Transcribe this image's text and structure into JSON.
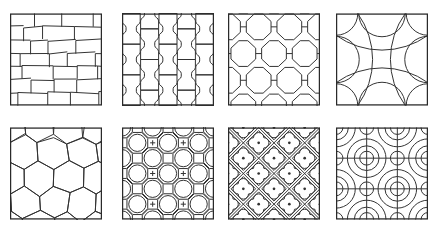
{
  "figure": {
    "name": "paving-pattern-catalog",
    "background": "#ffffff",
    "line_color": "#323232",
    "frame_color": "#2a2a2a",
    "grid": {
      "rows": 2,
      "columns": 4
    },
    "swatches": [
      {
        "name": "irregular-running-bond-brick",
        "type": "brick",
        "description": "staggered rectangular bricks in slightly irregular slanted courses",
        "rows": 7
      },
      {
        "name": "i-shaped-interlocking-pavers",
        "type": "spool",
        "description": "columns of dog-bone / I-shaped interlocking pavers, half-offset",
        "columns": 5
      },
      {
        "name": "uni-decor-octagon-pavers",
        "type": "octolink",
        "description": "staggered chamfered octagon pavers with short horizontal joint connectors"
      },
      {
        "name": "curved-bowtie-pavers",
        "type": "bowtie",
        "description": "interlocking curved bowtie and fan shaped paving units"
      },
      {
        "name": "irregular-hexagon-pavers",
        "type": "hex",
        "description": "irregular pointy-top hexagonal paving tiles"
      },
      {
        "name": "octagon-circle-inlay",
        "type": "circleocto",
        "description": "staggered octagons with inscribed circles and small cross marks in the gaps"
      },
      {
        "name": "diamond-quatrefoil-tiles",
        "type": "quatrefoil",
        "description": "diagonal diamond grid, each cell with inset diamond, quatrefoil medallion and center dot"
      },
      {
        "name": "breeze-block-quarter-arcs",
        "type": "breeze",
        "description": "3x3 screen blocks with concentric quarter-circle bands, alternating mirrored"
      }
    ],
    "layout": {
      "swatch_size": 92,
      "col_lefts": [
        10,
        122,
        228,
        336
      ],
      "row_tops": [
        13,
        127
      ]
    }
  }
}
